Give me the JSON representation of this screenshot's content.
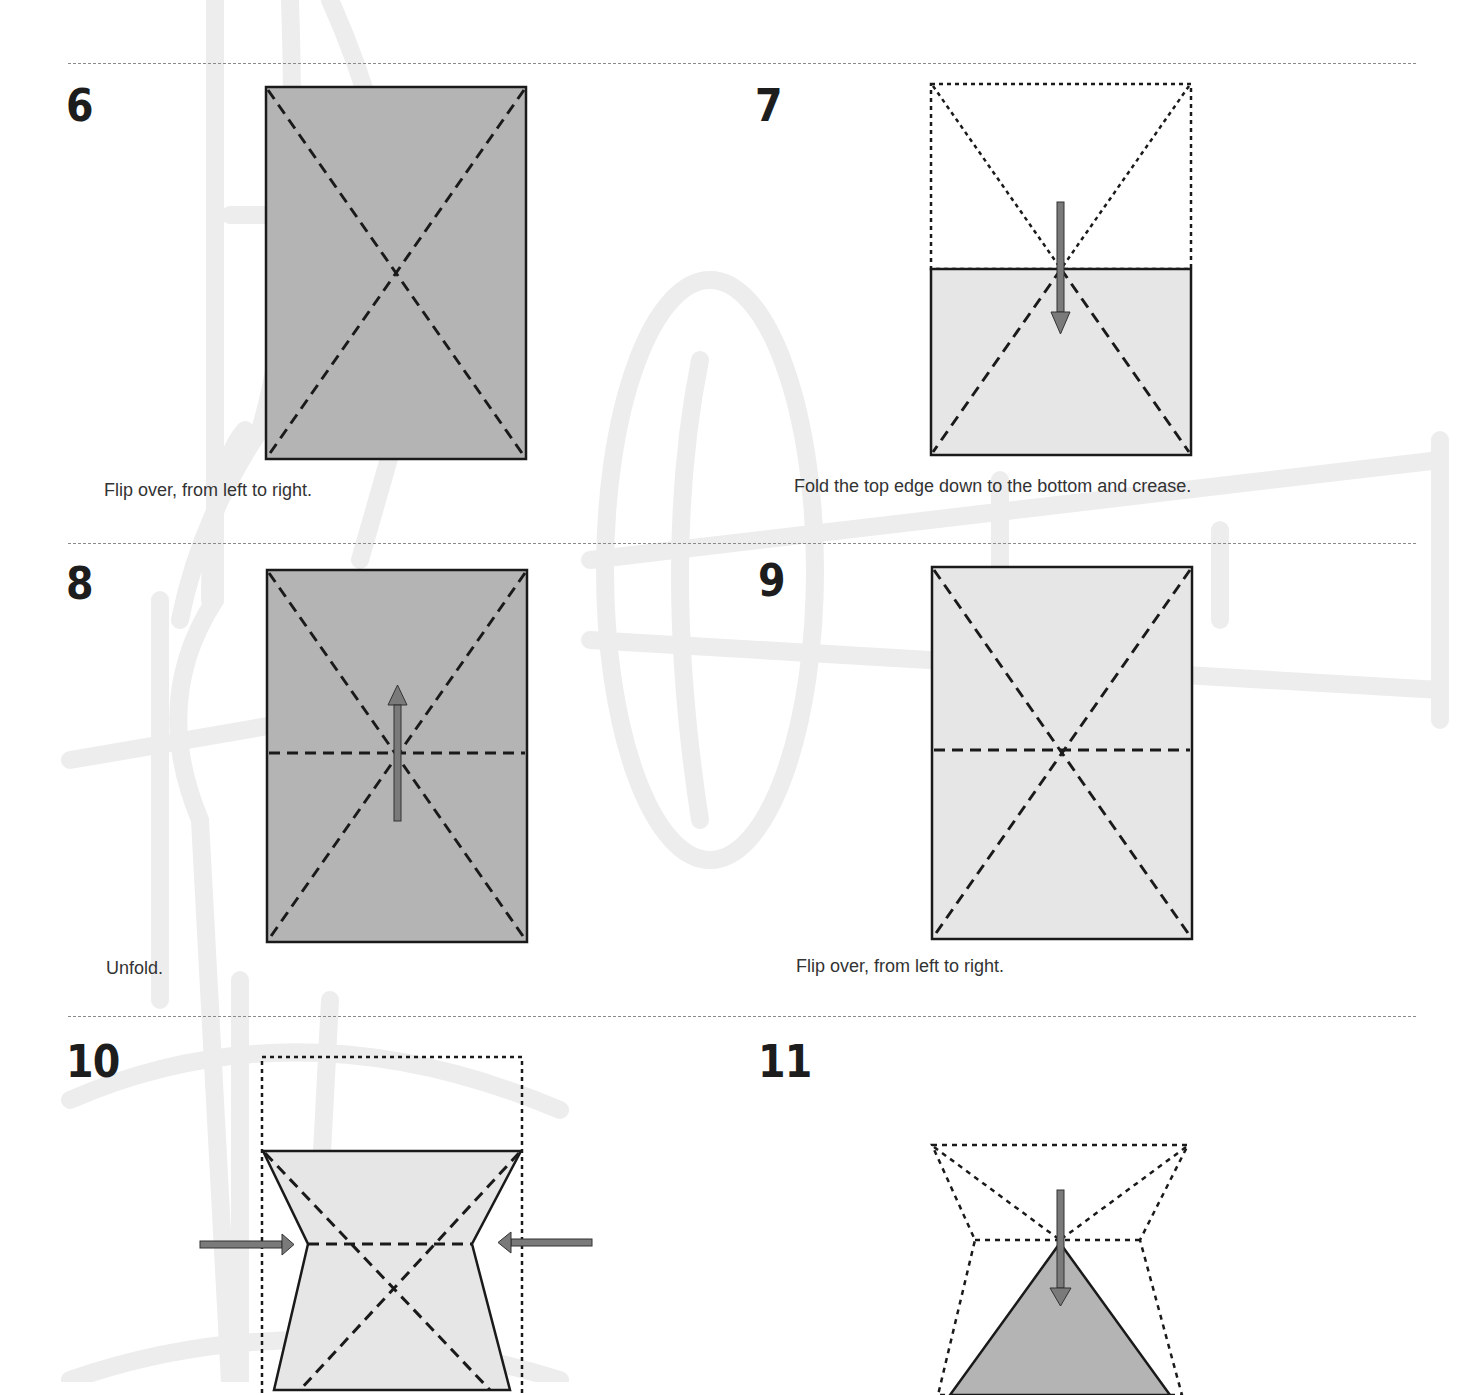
{
  "page": {
    "type": "origami-instructions",
    "colors": {
      "paper_dark": "#b4b4b4",
      "paper_light": "#e6e6e6",
      "line": "#1a1a1a",
      "arrow_fill": "#7a7a7a",
      "watermark": "#ececec",
      "rule": "#8a8a8a"
    }
  },
  "steps": [
    {
      "number": "6",
      "caption": "Flip over, from left to right.",
      "diagram": "dark rectangle with diagonal valley creases (X)"
    },
    {
      "number": "7",
      "caption": "Fold the top edge down to the bottom and crease.",
      "diagram": "light rectangle, top half dotted outline, down arrow"
    },
    {
      "number": "8",
      "caption": "Unfold.",
      "diagram": "dark rectangle with X and horizontal crease, up arrow"
    },
    {
      "number": "9",
      "caption": "Flip over, from left to right.",
      "diagram": "light rectangle with X and horizontal crease"
    },
    {
      "number": "10",
      "caption": "",
      "diagram": "light waterbomb collapse shape, arrows pushing inward from both sides"
    },
    {
      "number": "11",
      "caption": "",
      "diagram": "dark triangle with dotted outline of previous shape, down arrow"
    }
  ]
}
